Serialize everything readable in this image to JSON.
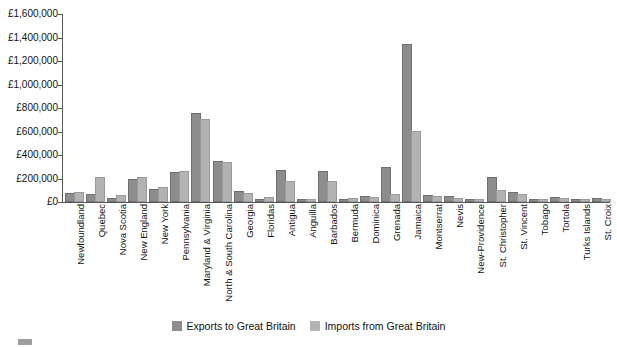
{
  "chart_data": {
    "type": "bar",
    "title": "",
    "xlabel": "",
    "ylabel": "",
    "ylim": [
      0,
      1600000
    ],
    "ytick_step": 200000,
    "currency_prefix": "£",
    "grid": false,
    "legend_position": "bottom",
    "ytick_labels": [
      "£1,600,000",
      "£1,400,000",
      "£1,200,000",
      "£1,000,000",
      "£800,000",
      "£600,000",
      "£400,000",
      "£200,000",
      "£0"
    ],
    "ytick_values": [
      1600000,
      1400000,
      1200000,
      1000000,
      800000,
      600000,
      400000,
      200000,
      0
    ],
    "categories": [
      "Newfoundland",
      "Quebec",
      "Nova Scotia",
      "New England",
      "New York",
      "Pennsylvania",
      "Maryland & Virginia",
      "North & South Carolina",
      "Georgia",
      "Floridas",
      "Antigua",
      "Anguilla",
      "Barbados",
      "Bermuda",
      "Dominica",
      "Grenada",
      "Jamaica",
      "Montserrat",
      "Nevis",
      "New-Providence",
      "St. Christopher",
      "St. Vincent",
      "Tobago",
      "Tortola",
      "Turks Islands",
      "St. Croix"
    ],
    "series": [
      {
        "name": "Exports to Great Britain",
        "color": "#8d8d8d",
        "values": [
          60000,
          55000,
          20000,
          175000,
          95000,
          240000,
          740000,
          330000,
          75000,
          10000,
          255000,
          8000,
          250000,
          12000,
          35000,
          280000,
          1330000,
          45000,
          30000,
          6000,
          195000,
          70000,
          5000,
          28000,
          4000,
          18000
        ]
      },
      {
        "name": "Imports from Great Britain",
        "color": "#b3b3b3",
        "values": [
          70000,
          200000,
          45000,
          195000,
          115000,
          245000,
          690000,
          325000,
          60000,
          22000,
          165000,
          5000,
          160000,
          20000,
          25000,
          55000,
          590000,
          30000,
          18000,
          12000,
          85000,
          55000,
          3000,
          20000,
          3000,
          8000
        ]
      }
    ]
  },
  "legend": {
    "items": [
      {
        "label": "Exports to Great Britain"
      },
      {
        "label": "Imports from Great Britain"
      }
    ]
  }
}
